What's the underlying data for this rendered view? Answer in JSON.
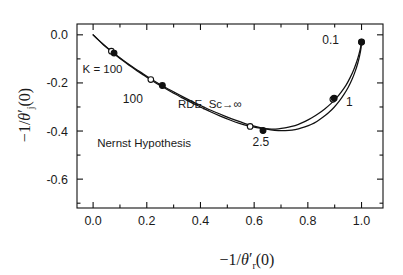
{
  "figure": {
    "width": 403,
    "height": 275,
    "background": "#ffffff",
    "ink_color": "#111111"
  },
  "axis_titles": {
    "x": "−1/θ′ᵣ(0)",
    "x_parts": {
      "prefix": "−1/",
      "theta": "θ",
      "prime": "′",
      "sub": "r",
      "suffix": "(0)"
    },
    "y": "−1/θ′ⱼ(0)",
    "y_parts": {
      "prefix": "−1/",
      "theta": "θ",
      "prime": "′",
      "sub": "j",
      "suffix": "(0)"
    }
  },
  "ticks": {
    "x_major_labels": [
      "0.0",
      "0.2",
      "0.4",
      "0.6",
      "0.8",
      "1.0"
    ],
    "x_major_values": [
      0.0,
      0.2,
      0.4,
      0.6,
      0.8,
      1.0
    ],
    "x_minor_values": [
      0.1,
      0.3,
      0.5,
      0.7,
      0.9
    ],
    "y_major_labels": [
      "-0.6",
      "-0.4",
      "-0.2",
      "0.0"
    ],
    "y_major_values": [
      -0.6,
      -0.4,
      -0.2,
      0.0
    ],
    "y_minor_values": [
      -0.7,
      -0.5,
      -0.3,
      -0.1
    ]
  },
  "annotations": [
    {
      "id": "nernst-hypothesis",
      "text": "Nernst Hypothesis",
      "x": 0.19,
      "y": -0.468
    },
    {
      "id": "rde-sc-infinity",
      "text": "RDE, Sc→∞",
      "x": 0.435,
      "y": -0.305
    },
    {
      "id": "k-equals-100",
      "text": "K = 100",
      "x": 0.035,
      "y": -0.158
    },
    {
      "id": "label-100",
      "text": "100",
      "x": 0.148,
      "y": -0.283
    },
    {
      "id": "label-2p5",
      "text": "2.5",
      "x": 0.625,
      "y": -0.462
    },
    {
      "id": "label-1",
      "text": "1",
      "x": 0.955,
      "y": -0.295
    },
    {
      "id": "label-0p1",
      "text": "0.1",
      "x": 0.885,
      "y": -0.038
    }
  ],
  "chart_data": {
    "type": "line",
    "title": "",
    "xlabel": "−1/θ′ᵣ(0)",
    "ylabel": "−1/θ′ⱼ(0)",
    "xlim": [
      -0.06,
      1.08
    ],
    "ylim": [
      -0.72,
      0.045
    ],
    "grid": false,
    "legend": "inline-annotations",
    "series": [
      {
        "name": "Nernst Hypothesis",
        "marker": "open-circle",
        "x": [
          0.0,
          0.018,
          0.038,
          0.06,
          0.083,
          0.108,
          0.135,
          0.163,
          0.193,
          0.225,
          0.258,
          0.292,
          0.327,
          0.363,
          0.4,
          0.437,
          0.474,
          0.51,
          0.545,
          0.578,
          0.609,
          0.638,
          0.665,
          0.69,
          0.715,
          0.74,
          0.765,
          0.79,
          0.815,
          0.84,
          0.863,
          0.885,
          0.906,
          0.925,
          0.943,
          0.958,
          0.971,
          0.982,
          0.99,
          0.996,
          1.0
        ],
        "y": [
          0.0,
          -0.02,
          -0.041,
          -0.062,
          -0.083,
          -0.105,
          -0.127,
          -0.149,
          -0.171,
          -0.194,
          -0.216,
          -0.238,
          -0.259,
          -0.28,
          -0.3,
          -0.32,
          -0.338,
          -0.354,
          -0.368,
          -0.379,
          -0.386,
          -0.39,
          -0.392,
          -0.391,
          -0.387,
          -0.381,
          -0.372,
          -0.36,
          -0.345,
          -0.327,
          -0.308,
          -0.287,
          -0.263,
          -0.237,
          -0.208,
          -0.177,
          -0.145,
          -0.112,
          -0.082,
          -0.055,
          -0.03
        ],
        "markers": [
          {
            "x": 0.068,
            "y": -0.068,
            "label": "100",
            "filled": false
          },
          {
            "x": 0.215,
            "y": -0.186,
            "label": "100",
            "filled": false
          },
          {
            "x": 0.585,
            "y": -0.381,
            "label": "2.5",
            "filled": false
          },
          {
            "x": 0.893,
            "y": -0.268,
            "label": "1",
            "filled": false
          },
          {
            "x": 1.0,
            "y": -0.03,
            "label": "0.1",
            "filled": false
          }
        ]
      },
      {
        "name": "RDE, Sc→∞",
        "marker": "filled-circle",
        "x": [
          0.0,
          0.02,
          0.042,
          0.065,
          0.09,
          0.117,
          0.145,
          0.175,
          0.206,
          0.239,
          0.273,
          0.308,
          0.344,
          0.381,
          0.418,
          0.456,
          0.493,
          0.53,
          0.566,
          0.6,
          0.632,
          0.662,
          0.69,
          0.716,
          0.741,
          0.765,
          0.789,
          0.812,
          0.835,
          0.857,
          0.878,
          0.898,
          0.917,
          0.934,
          0.95,
          0.964,
          0.976,
          0.986,
          0.993,
          0.998,
          1.0
        ],
        "y": [
          0.0,
          -0.021,
          -0.043,
          -0.065,
          -0.087,
          -0.11,
          -0.132,
          -0.154,
          -0.177,
          -0.199,
          -0.221,
          -0.242,
          -0.263,
          -0.284,
          -0.303,
          -0.322,
          -0.339,
          -0.355,
          -0.369,
          -0.38,
          -0.389,
          -0.395,
          -0.398,
          -0.398,
          -0.396,
          -0.391,
          -0.383,
          -0.373,
          -0.359,
          -0.342,
          -0.323,
          -0.301,
          -0.276,
          -0.249,
          -0.219,
          -0.187,
          -0.153,
          -0.118,
          -0.086,
          -0.056,
          -0.03
        ],
        "markers": [
          {
            "x": 0.078,
            "y": -0.076,
            "label": "100",
            "filled": true
          },
          {
            "x": 0.258,
            "y": -0.211,
            "label": "100",
            "filled": true
          },
          {
            "x": 0.633,
            "y": -0.398,
            "label": "2.5",
            "filled": true
          },
          {
            "x": 0.898,
            "y": -0.264,
            "label": "1",
            "filled": true
          },
          {
            "x": 1.0,
            "y": -0.03,
            "label": "0.1",
            "filled": true
          }
        ]
      }
    ]
  }
}
